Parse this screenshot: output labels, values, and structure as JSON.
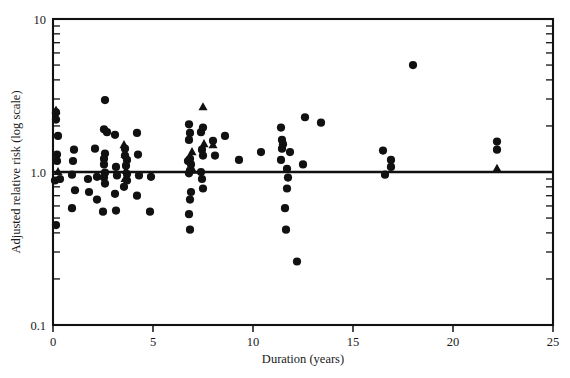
{
  "chart_data": {
    "type": "scatter",
    "title": "",
    "xlabel": "Duration (years)",
    "ylabel": "Adjusted relative risk (log scale)",
    "xlim": [
      0,
      25
    ],
    "ylim": [
      0.1,
      10
    ],
    "yscale": "log",
    "xscale": "linear",
    "grid": false,
    "legend": false,
    "xticks": [
      0,
      5,
      10,
      15,
      20,
      25
    ],
    "xtick_labels": [
      "0",
      "5",
      "10",
      "15",
      "20",
      "25"
    ],
    "yticks": [
      0.1,
      1.0,
      10
    ],
    "ytick_labels": [
      "0.1",
      "1.0",
      "10"
    ],
    "yminor_ticks": [
      0.2,
      0.3,
      0.4,
      0.5,
      0.6,
      0.7,
      0.8,
      0.9,
      2,
      3,
      4,
      5,
      6,
      7,
      8,
      9
    ],
    "reference_line": {
      "y": 1.0,
      "label": ""
    },
    "marker_color": "#111111",
    "series": [
      {
        "name": "circle",
        "marker": "circle",
        "points": [
          [
            0.15,
            2.45
          ],
          [
            0.15,
            2.2
          ],
          [
            0.25,
            1.72
          ],
          [
            0.2,
            1.3
          ],
          [
            0.2,
            1.18
          ],
          [
            0.1,
            0.88
          ],
          [
            0.35,
            0.9
          ],
          [
            0.15,
            0.45
          ],
          [
            0.95,
            0.96
          ],
          [
            1.05,
            1.4
          ],
          [
            1.0,
            1.18
          ],
          [
            1.1,
            0.76
          ],
          [
            0.95,
            0.58
          ],
          [
            1.75,
            0.9
          ],
          [
            1.8,
            0.74
          ],
          [
            2.1,
            1.42
          ],
          [
            2.2,
            0.93
          ],
          [
            2.2,
            0.66
          ],
          [
            2.6,
            2.95
          ],
          [
            2.55,
            1.9
          ],
          [
            2.7,
            1.82
          ],
          [
            2.6,
            1.32
          ],
          [
            2.55,
            1.22
          ],
          [
            2.55,
            1.12
          ],
          [
            2.6,
            0.99
          ],
          [
            2.55,
            0.92
          ],
          [
            2.6,
            0.84
          ],
          [
            2.5,
            0.55
          ],
          [
            3.1,
            1.75
          ],
          [
            3.15,
            1.08
          ],
          [
            3.2,
            0.95
          ],
          [
            3.1,
            0.72
          ],
          [
            3.15,
            0.56
          ],
          [
            3.6,
            1.42
          ],
          [
            3.6,
            1.28
          ],
          [
            3.7,
            1.2
          ],
          [
            3.65,
            1.1
          ],
          [
            3.7,
            0.97
          ],
          [
            3.7,
            0.88
          ],
          [
            3.55,
            0.8
          ],
          [
            4.2,
            1.8
          ],
          [
            4.25,
            1.3
          ],
          [
            4.3,
            0.95
          ],
          [
            4.2,
            0.7
          ],
          [
            4.9,
            0.93
          ],
          [
            4.85,
            0.55
          ],
          [
            6.8,
            2.05
          ],
          [
            6.85,
            1.8
          ],
          [
            6.8,
            1.62
          ],
          [
            6.85,
            1.22
          ],
          [
            6.75,
            1.18
          ],
          [
            6.9,
            1.12
          ],
          [
            6.85,
            1.02
          ],
          [
            6.8,
            0.98
          ],
          [
            6.9,
            0.74
          ],
          [
            6.85,
            0.66
          ],
          [
            6.8,
            0.53
          ],
          [
            6.85,
            0.42
          ],
          [
            7.4,
            1.82
          ],
          [
            7.5,
            1.95
          ],
          [
            7.45,
            1.4
          ],
          [
            7.5,
            1.28
          ],
          [
            7.4,
            1.0
          ],
          [
            7.45,
            0.9
          ],
          [
            7.5,
            0.78
          ],
          [
            8.0,
            1.6
          ],
          [
            8.1,
            1.28
          ],
          [
            8.6,
            1.72
          ],
          [
            9.3,
            1.2
          ],
          [
            10.4,
            1.35
          ],
          [
            11.4,
            1.95
          ],
          [
            11.45,
            1.62
          ],
          [
            11.5,
            1.52
          ],
          [
            11.45,
            1.42
          ],
          [
            11.4,
            1.2
          ],
          [
            11.85,
            1.35
          ],
          [
            11.7,
            1.05
          ],
          [
            11.75,
            0.92
          ],
          [
            11.7,
            0.78
          ],
          [
            11.6,
            0.58
          ],
          [
            11.65,
            0.42
          ],
          [
            12.2,
            0.26
          ],
          [
            12.6,
            2.28
          ],
          [
            12.5,
            1.12
          ],
          [
            13.4,
            2.1
          ],
          [
            16.5,
            1.38
          ],
          [
            16.9,
            1.2
          ],
          [
            16.9,
            1.08
          ],
          [
            16.6,
            0.96
          ],
          [
            18.0,
            5.0
          ],
          [
            22.2,
            1.58
          ],
          [
            22.2,
            1.4
          ]
        ]
      },
      {
        "name": "triangle",
        "marker": "triangle",
        "points": [
          [
            0.15,
            2.52
          ],
          [
            0.25,
            1.0
          ],
          [
            3.55,
            1.5
          ],
          [
            3.6,
            1.3
          ],
          [
            3.65,
            1.02
          ],
          [
            3.6,
            0.9
          ],
          [
            6.95,
            1.35
          ],
          [
            7.0,
            1.02
          ],
          [
            7.5,
            2.65
          ],
          [
            7.55,
            1.52
          ],
          [
            8.0,
            1.5
          ],
          [
            22.2,
            1.05
          ]
        ]
      }
    ]
  },
  "axes": {
    "x_title": "Duration (years)",
    "y_title": "Adjusted relative risk (log scale)",
    "x_labels": [
      "0",
      "5",
      "10",
      "15",
      "20",
      "25"
    ],
    "y_labels": [
      "10",
      "1.0",
      "0.1"
    ]
  }
}
